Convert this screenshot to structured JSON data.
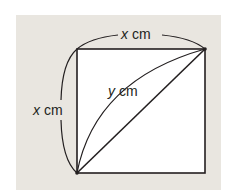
{
  "diagram": {
    "title": "",
    "colors": {
      "background": "#ffffff",
      "panel": "#e9e6e0",
      "square_fill": "#ffffff",
      "stroke": "#231f20"
    },
    "square": {
      "top_left": [
        77,
        49
      ],
      "top_right": [
        205,
        49
      ],
      "bottom_right": [
        205,
        173
      ],
      "bottom_left": [
        77,
        173
      ]
    },
    "labels": {
      "top": {
        "var": "x",
        "unit": " cm"
      },
      "left": {
        "var": "x",
        "unit": " cm"
      },
      "curve": {
        "var": "y",
        "unit": " cm"
      }
    },
    "elements": [
      "square with side x cm",
      "straight diagonal from bottom-left to top-right",
      "curved arc from bottom-left to top-right labelled y cm",
      "dimension arc above top side labelled x cm",
      "dimension arc left of left side labelled x cm"
    ]
  }
}
